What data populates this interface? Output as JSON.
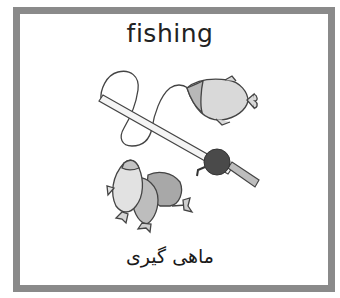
{
  "card": {
    "title": "fishing",
    "caption": "ماهی گیری",
    "border_color": "#8a8a8a",
    "background_color": "#ffffff"
  },
  "illustration": {
    "subject": "fishing-rod-with-fish",
    "elements": [
      "fishing-rod",
      "fishing-line",
      "reel",
      "hooked-fish",
      "fish-pile"
    ]
  }
}
